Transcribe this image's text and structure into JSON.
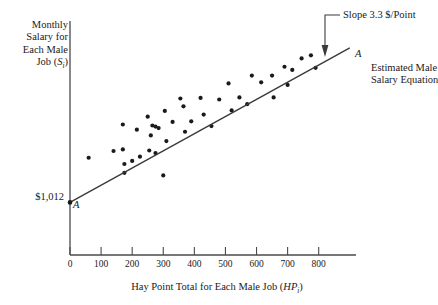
{
  "chart_data": {
    "type": "scatter",
    "title": "",
    "xlabel": "Hay Point Total for Each Male Job (HP",
    "xlabel_sub": "i",
    "xlabel_tail": ")",
    "ylabel_lines": [
      "Monthly",
      "Salary for",
      "Each Male",
      "Job (S"
    ],
    "ylabel_sub": "i",
    "ylabel_tail": ")",
    "xticks": [
      "0",
      "100",
      "200",
      "300",
      "400",
      "500",
      "600",
      "700",
      "800"
    ],
    "xtick_values": [
      0,
      100,
      200,
      300,
      400,
      500,
      600,
      700,
      800
    ],
    "xlim": [
      0,
      920
    ],
    "ylim": [
      0,
      4500
    ],
    "grid": false,
    "yaxis_intercept_label": "$1,012",
    "intercept_value": 1012,
    "slope_value": 3.3,
    "slope_units": "$/Point",
    "annotations": [
      {
        "name": "slope-annotation",
        "text": "Slope 3.3 $/Point"
      },
      {
        "name": "line-caption",
        "text": "Estimated Male\nSalary Equation"
      },
      {
        "name": "marker-a-origin",
        "text": "A"
      },
      {
        "name": "marker-a-end",
        "text": "A"
      }
    ],
    "fit_line": {
      "label": "A",
      "x_start": 0,
      "y_start": 1012,
      "x_end": 900,
      "y_end": 3982
    },
    "points": [
      {
        "x": 60,
        "y": 1870
      },
      {
        "x": 140,
        "y": 2000
      },
      {
        "x": 170,
        "y": 2510
      },
      {
        "x": 170,
        "y": 2030
      },
      {
        "x": 175,
        "y": 1750
      },
      {
        "x": 175,
        "y": 1580
      },
      {
        "x": 200,
        "y": 1810
      },
      {
        "x": 215,
        "y": 2410
      },
      {
        "x": 225,
        "y": 1890
      },
      {
        "x": 250,
        "y": 2660
      },
      {
        "x": 255,
        "y": 2010
      },
      {
        "x": 260,
        "y": 2300
      },
      {
        "x": 265,
        "y": 2490
      },
      {
        "x": 275,
        "y": 2470
      },
      {
        "x": 275,
        "y": 1960
      },
      {
        "x": 285,
        "y": 2440
      },
      {
        "x": 300,
        "y": 1530
      },
      {
        "x": 305,
        "y": 2770
      },
      {
        "x": 310,
        "y": 2190
      },
      {
        "x": 330,
        "y": 2560
      },
      {
        "x": 355,
        "y": 3010
      },
      {
        "x": 365,
        "y": 2860
      },
      {
        "x": 370,
        "y": 2370
      },
      {
        "x": 390,
        "y": 2570
      },
      {
        "x": 420,
        "y": 3020
      },
      {
        "x": 430,
        "y": 2700
      },
      {
        "x": 455,
        "y": 2480
      },
      {
        "x": 480,
        "y": 2990
      },
      {
        "x": 510,
        "y": 3300
      },
      {
        "x": 520,
        "y": 2780
      },
      {
        "x": 545,
        "y": 3030
      },
      {
        "x": 570,
        "y": 2900
      },
      {
        "x": 585,
        "y": 3450
      },
      {
        "x": 615,
        "y": 3320
      },
      {
        "x": 650,
        "y": 3450
      },
      {
        "x": 655,
        "y": 3030
      },
      {
        "x": 690,
        "y": 3620
      },
      {
        "x": 700,
        "y": 3270
      },
      {
        "x": 715,
        "y": 3560
      },
      {
        "x": 745,
        "y": 3780
      },
      {
        "x": 775,
        "y": 3840
      },
      {
        "x": 790,
        "y": 3600
      }
    ]
  }
}
